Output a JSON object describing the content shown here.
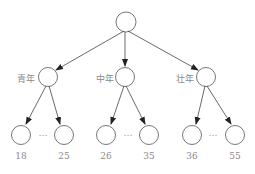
{
  "diagram": {
    "root": {
      "label": ""
    },
    "groups": [
      {
        "label": "青年",
        "children": [
          "18",
          "25"
        ],
        "ellipsis": "…"
      },
      {
        "label": "中年",
        "children": [
          "26",
          "35"
        ],
        "ellipsis": "…"
      },
      {
        "label": "壮年",
        "children": [
          "36",
          "55"
        ],
        "ellipsis": "…"
      }
    ],
    "colors": {
      "stroke": "#555555",
      "text": "#8a8a8a"
    }
  }
}
